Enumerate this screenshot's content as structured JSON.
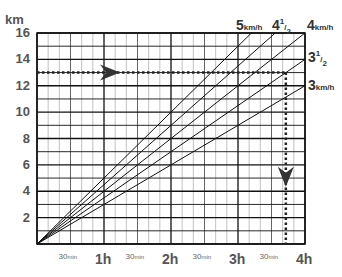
{
  "chart_data": {
    "type": "line",
    "title": "",
    "xlabel": "",
    "ylabel": "km",
    "xlim": [
      0,
      4
    ],
    "ylim": [
      0,
      16
    ],
    "grid": true,
    "x_ticks": [
      {
        "pos": 0.5,
        "label": "30",
        "unit": "min",
        "minor": true
      },
      {
        "pos": 1,
        "label": "1h"
      },
      {
        "pos": 1.5,
        "label": "30",
        "unit": "min",
        "minor": true
      },
      {
        "pos": 2,
        "label": "2h"
      },
      {
        "pos": 2.5,
        "label": "30",
        "unit": "min",
        "minor": true
      },
      {
        "pos": 3,
        "label": "3h"
      },
      {
        "pos": 3.5,
        "label": "30",
        "unit": "min",
        "minor": true
      },
      {
        "pos": 4,
        "label": "4h"
      }
    ],
    "y_ticks": [
      2,
      4,
      6,
      8,
      10,
      12,
      14,
      16
    ],
    "series": [
      {
        "name": "5 km/h",
        "speed": 5,
        "x": [
          0,
          3.2
        ],
        "y": [
          0,
          16
        ]
      },
      {
        "name": "4 1/2",
        "speed": 4.5,
        "x": [
          0,
          3.556
        ],
        "y": [
          0,
          16
        ]
      },
      {
        "name": "4 km/h",
        "speed": 4,
        "x": [
          0,
          4
        ],
        "y": [
          0,
          16
        ]
      },
      {
        "name": "3 1/2",
        "speed": 3.5,
        "x": [
          0,
          4
        ],
        "y": [
          0,
          14
        ]
      },
      {
        "name": "3 km/h",
        "speed": 3,
        "x": [
          0,
          4
        ],
        "y": [
          0,
          12
        ]
      }
    ],
    "annotations": [
      {
        "type": "dotted-arrow",
        "direction": "right",
        "from": [
          0,
          13
        ],
        "to": [
          3.714,
          13
        ]
      },
      {
        "type": "dotted-arrow",
        "direction": "down",
        "from": [
          3.714,
          13
        ],
        "to": [
          3.714,
          0
        ]
      }
    ],
    "series_labels": [
      {
        "main": "5",
        "unit": "km/h"
      },
      {
        "main": "4",
        "frac": "1/2"
      },
      {
        "main": "4",
        "unit": "km/h"
      },
      {
        "main": "3",
        "frac": "1/2"
      },
      {
        "main": "3",
        "unit": "km/h"
      }
    ]
  }
}
